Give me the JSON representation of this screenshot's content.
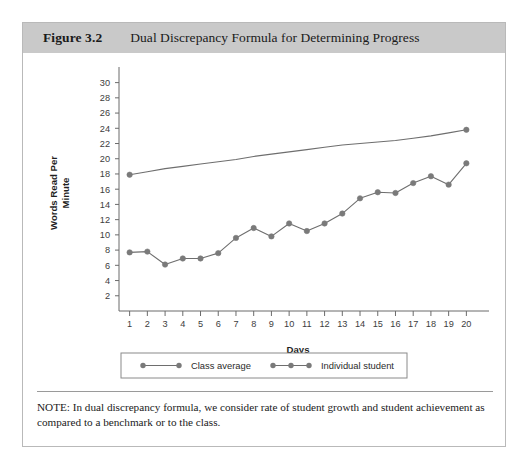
{
  "figure": {
    "number": "Figure 3.2",
    "title": "Dual Discrepancy Formula for Determining Progress"
  },
  "note": {
    "text": "NOTE: In dual discrepancy formula, we consider rate of student growth and student achievement as compared to a benchmark or to the class."
  },
  "colors": {
    "header_band": "#c9c9c9",
    "card_border": "#b9b9b9",
    "line": "#6e6e6e",
    "marker": "#7a7a7a",
    "axis": "#6b6b6b",
    "text": "#1a1a1a"
  },
  "chart_data": {
    "type": "line",
    "title": "",
    "xlabel": "Days",
    "ylabel": "Words Read Per Minute",
    "ylabel_lines": [
      "Words Read Per",
      "Minute"
    ],
    "x": [
      1,
      2,
      3,
      4,
      5,
      6,
      7,
      8,
      9,
      10,
      11,
      12,
      13,
      14,
      15,
      16,
      17,
      18,
      19,
      20
    ],
    "xtick_labels": [
      "1",
      "2",
      "3",
      "4",
      "5",
      "6",
      "7",
      "8",
      "9",
      "10",
      "11",
      "12",
      "13",
      "14",
      "15",
      "16",
      "17",
      "18",
      "19",
      "20"
    ],
    "ytick_labels": [
      "2",
      "4",
      "6",
      "8",
      "10",
      "12",
      "14",
      "16",
      "18",
      "20",
      "22",
      "24",
      "26",
      "28",
      "30"
    ],
    "yticks": [
      2,
      4,
      6,
      8,
      10,
      12,
      14,
      16,
      18,
      20,
      22,
      24,
      26,
      28,
      30
    ],
    "ylim": [
      0,
      31
    ],
    "xlim": [
      0.4,
      20.6
    ],
    "grid": false,
    "legend_position": "bottom",
    "series": [
      {
        "name": "Class average",
        "markers": "endpoints",
        "values": [
          17.9,
          18.3,
          18.7,
          19.0,
          19.3,
          19.6,
          19.9,
          20.3,
          20.6,
          20.9,
          21.2,
          21.5,
          21.8,
          22.0,
          22.2,
          22.4,
          22.7,
          23.0,
          23.4,
          23.8
        ]
      },
      {
        "name": "Individual student",
        "markers": "all",
        "values": [
          7.7,
          7.8,
          6.1,
          6.9,
          6.9,
          7.6,
          9.6,
          10.9,
          9.8,
          11.5,
          10.5,
          11.5,
          12.8,
          14.8,
          15.6,
          15.5,
          16.8,
          17.7,
          16.6,
          19.4
        ]
      }
    ]
  },
  "legend": {
    "items": [
      {
        "label": "Class average"
      },
      {
        "label": "Individual student"
      }
    ]
  }
}
